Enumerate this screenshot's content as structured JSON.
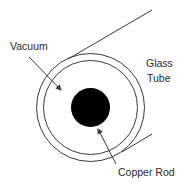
{
  "diagram": {
    "labels": {
      "vacuum": "Vacuum",
      "glass_line1": "Glass",
      "glass_line2": "Tube",
      "copper_rod": "Copper Rod"
    },
    "colors": {
      "stroke": "#3a3a3a",
      "rod_fill": "#000000",
      "background": "#ffffff"
    },
    "geometry": {
      "center": [
        90.5,
        107.5
      ],
      "outer_radius": 54,
      "inner_radius": 47,
      "rod_radius": 19.5
    }
  }
}
